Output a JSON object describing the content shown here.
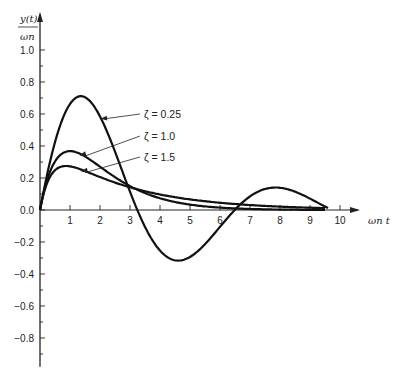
{
  "chart_data": {
    "type": "line",
    "title": "",
    "xlabel": "ωn t",
    "ylabel": "y(t) / ωn",
    "xlim": [
      0,
      10.6
    ],
    "ylim": [
      -1.0,
      1.1
    ],
    "grid": false,
    "legend_position": "inline-annotations",
    "x_ticks": [
      1,
      2,
      3,
      4,
      5,
      6,
      7,
      8,
      9,
      10
    ],
    "y_ticks": [
      1.0,
      0.8,
      0.6,
      0.4,
      0.2,
      0.0,
      -0.2,
      -0.4,
      -0.6,
      -0.8
    ],
    "y_tick_labels": [
      "1.0",
      "0.8",
      "0.6",
      "0.4",
      "0.2",
      "0.0",
      "−0.2",
      "−0.4",
      "−0.6",
      "−0.8"
    ],
    "x_tick_labels": [
      "1",
      "2",
      "3",
      "4",
      "5",
      "6",
      "7",
      "8",
      "9",
      "10"
    ],
    "series": [
      {
        "name": "ζ = 0.25",
        "zeta": 0.25,
        "x": [
          0,
          0.5,
          1.0,
          1.5,
          2.0,
          2.5,
          3.0,
          3.5,
          4.0,
          4.5,
          5.0,
          5.5,
          6.0,
          6.5,
          7.0,
          7.5,
          8.0,
          8.5,
          9.0,
          9.5
        ],
        "values": [
          0.0,
          0.43,
          0.65,
          0.7,
          0.58,
          0.35,
          0.08,
          -0.14,
          -0.27,
          -0.3,
          -0.26,
          -0.16,
          -0.05,
          0.05,
          0.1,
          0.12,
          0.11,
          0.07,
          0.03,
          -0.01
        ]
      },
      {
        "name": "ζ = 1.0",
        "zeta": 1.0,
        "x": [
          0,
          0.5,
          1.0,
          1.5,
          2.0,
          3.0,
          4.0,
          5.0,
          6.0,
          7.0,
          8.0,
          9.0,
          9.5
        ],
        "values": [
          0.0,
          0.3,
          0.37,
          0.33,
          0.27,
          0.15,
          0.07,
          0.03,
          0.015,
          0.006,
          0.003,
          0.001,
          0.0007
        ]
      },
      {
        "name": "ζ = 1.5",
        "zeta": 1.5,
        "x": [
          0,
          0.5,
          1.0,
          1.5,
          2.0,
          3.0,
          4.0,
          5.0,
          6.0,
          7.0,
          8.0,
          9.0,
          9.5
        ],
        "values": [
          0.0,
          0.23,
          0.26,
          0.24,
          0.21,
          0.15,
          0.1,
          0.07,
          0.05,
          0.03,
          0.02,
          0.015,
          0.012
        ]
      }
    ],
    "annotations": [
      {
        "label": "ζ = 0.25",
        "arrow_to_x": 1.95,
        "arrow_to_y": 0.57
      },
      {
        "label": "ζ = 1.0",
        "arrow_to_x": 1.25,
        "arrow_to_y": 0.34
      },
      {
        "label": "ζ = 1.5",
        "arrow_to_x": 1.3,
        "arrow_to_y": 0.24
      }
    ]
  },
  "axes": {
    "y_title_top": "y(t)",
    "y_title_bottom": "ωn",
    "x_title": "ωn t"
  }
}
